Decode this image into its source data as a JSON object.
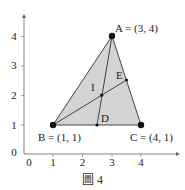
{
  "figure": {
    "caption": "圖 4",
    "x_ticks": [
      "0",
      "1",
      "2",
      "3",
      "4"
    ],
    "y_ticks": [
      "0",
      "1",
      "2",
      "3",
      "4"
    ],
    "points": {
      "A": {
        "label": "A = (3, 4)",
        "x": 3,
        "y": 4
      },
      "B": {
        "label": "B = (1, 1)",
        "x": 1,
        "y": 1
      },
      "C": {
        "label": "C = (4, 1)",
        "x": 4,
        "y": 1
      },
      "D": {
        "label": "D",
        "x": 2.5,
        "y": 1
      },
      "E": {
        "label": "E",
        "x": 3.5,
        "y": 2.5
      },
      "I": {
        "label": "I",
        "x": 2.67,
        "y": 2
      }
    },
    "fill_color": "#d3d3d3",
    "line_color": "#333333"
  }
}
